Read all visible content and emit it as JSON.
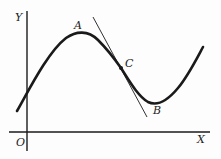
{
  "figure": {
    "axes": {
      "x_label": "X",
      "y_label": "Y",
      "origin_label": "O"
    },
    "points": [
      {
        "name": "A",
        "description": "local maximum"
      },
      {
        "name": "C",
        "description": "point of inflection, tangent drawn"
      },
      {
        "name": "B",
        "description": "local minimum"
      }
    ]
  },
  "colors": {
    "ink": "#1a1a1a",
    "background": "#fdfdfd"
  }
}
